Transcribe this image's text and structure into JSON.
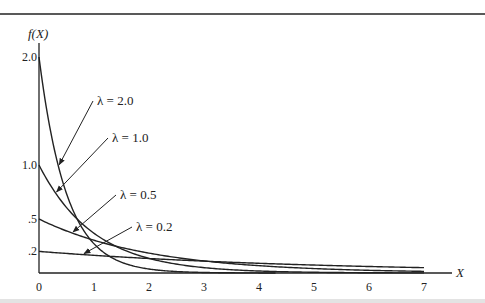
{
  "chart_data": {
    "type": "line",
    "title": "",
    "xlabel": "X",
    "ylabel": "f(X)",
    "xlim": [
      0,
      7
    ],
    "ylim": [
      0,
      2.0
    ],
    "x_ticks": [
      "0",
      "1",
      "2",
      "3",
      "4",
      "5",
      "6",
      "7"
    ],
    "y_ticks": [
      {
        "value": 2.0,
        "label": "2.0"
      },
      {
        "value": 1.0,
        "label": "1.0"
      },
      {
        "value": 0.5,
        "label": ".5"
      },
      {
        "value": 0.2,
        "label": ".2"
      }
    ],
    "grid": false,
    "legend": "inline annotations with arrows",
    "formula": "f(X) = λ e^(-λX)",
    "series": [
      {
        "name": "λ = 2.0",
        "lambda": 2.0,
        "x_max": 4.3,
        "x": [
          0,
          0.25,
          0.5,
          1,
          1.5,
          2,
          3,
          4
        ],
        "values": [
          2.0,
          1.213,
          0.736,
          0.271,
          0.1,
          0.037,
          0.005,
          0.001
        ]
      },
      {
        "name": "λ = 1.0",
        "lambda": 1.0,
        "x_max": 7,
        "x": [
          0,
          0.5,
          1,
          2,
          3,
          4,
          5,
          6,
          7
        ],
        "values": [
          1.0,
          0.607,
          0.368,
          0.135,
          0.05,
          0.018,
          0.007,
          0.002,
          0.001
        ]
      },
      {
        "name": "λ = 0.5",
        "lambda": 0.5,
        "x_max": 7,
        "x": [
          0,
          1,
          2,
          3,
          4,
          5,
          6,
          7
        ],
        "values": [
          0.5,
          0.303,
          0.184,
          0.112,
          0.068,
          0.041,
          0.025,
          0.015
        ]
      },
      {
        "name": "λ = 0.2",
        "lambda": 0.2,
        "x_max": 7,
        "x": [
          0,
          1,
          2,
          3,
          4,
          5,
          6,
          7
        ],
        "values": [
          0.2,
          0.164,
          0.134,
          0.11,
          0.09,
          0.074,
          0.06,
          0.049
        ]
      }
    ],
    "annotations": [
      {
        "text": "λ = 2.0",
        "label_pos": [
          97,
          105
        ],
        "arrow_to_x": 0.35
      },
      {
        "text": "λ = 1.0",
        "label_pos": [
          112,
          142
        ],
        "arrow_to_x": 0.3
      },
      {
        "text": "λ = 0.5",
        "label_pos": [
          120,
          199
        ],
        "arrow_to_x": 0.6
      },
      {
        "text": "λ = 0.2",
        "label_pos": [
          136,
          231
        ],
        "arrow_to_x": 0.8
      }
    ]
  }
}
